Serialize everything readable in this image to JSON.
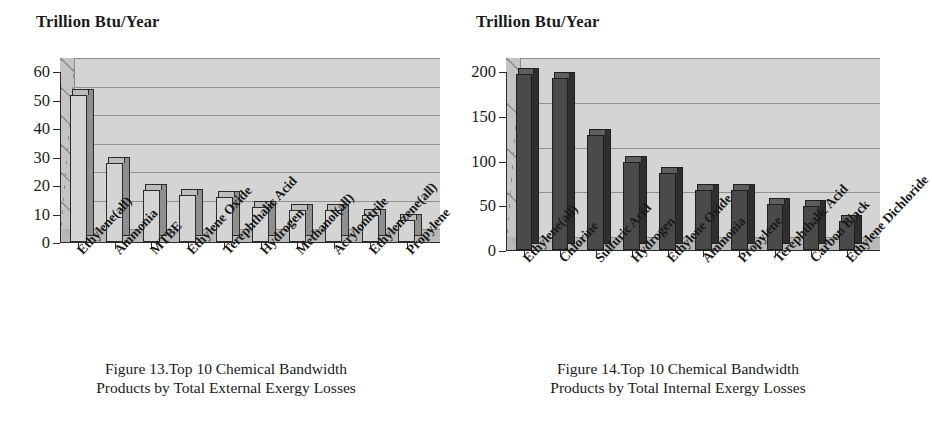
{
  "figures": [
    {
      "axis_title": "Trillion Btu/Year",
      "caption_line1": "Figure 13.Top 10 Chemical Bandwidth",
      "caption_line2": "Products by Total External Exergy Losses",
      "chart_data": {
        "type": "bar",
        "title": "Figure 13.Top 10 Chemical Bandwidth Products by Total External Exergy Losses",
        "xlabel": "",
        "ylabel": "Trillion Btu/Year",
        "ylim": [
          0,
          60
        ],
        "yticks": [
          0,
          10,
          20,
          30,
          40,
          50,
          60
        ],
        "ytick_labels": [
          "0",
          "10",
          "20",
          "30",
          "40",
          "50",
          "60"
        ],
        "grid": true,
        "legend": "none",
        "categories": [
          "Ethylene(all)",
          "Ammonia",
          "MTBE",
          "Ethylene Oxide",
          "Terephthalic Acid",
          "Hydrogen",
          "Methanol(all)",
          "Acrylonitrile",
          "Ethylenzene(all)",
          "Propylene"
        ],
        "values": [
          52,
          28,
          18.5,
          17,
          16,
          12.5,
          11.5,
          11.5,
          10,
          8
        ],
        "bar_fill": "#d4d4d4",
        "bar_edge": "#2b2b2b"
      }
    },
    {
      "axis_title": "Trillion Btu/Year",
      "caption_line1": "Figure 14.Top 10 Chemical Bandwidth",
      "caption_line2": "Products by Total Internal Exergy Losses",
      "chart_data": {
        "type": "bar",
        "title": "Figure 14.Top 10 Chemical Bandwidth Products by Total Internal Exergy Losses",
        "xlabel": "",
        "ylabel": "Trillion Btu/Year",
        "ylim": [
          0,
          200
        ],
        "yticks": [
          0,
          50,
          100,
          150,
          200
        ],
        "ytick_labels": [
          "0",
          "50",
          "100",
          "150",
          "200"
        ],
        "grid": true,
        "legend": "none",
        "categories": [
          "Ethylene(all)",
          "Chlorine",
          "Sulfuric Acid",
          "Hydrogen",
          "Ethylene Oxide",
          "Ammonia",
          "Propylene",
          "Terephthalic Acid",
          "Carbon Black",
          "Ethylene Dichloride"
        ],
        "values": [
          198,
          193,
          130,
          100,
          87,
          68,
          68,
          52,
          50,
          34
        ],
        "bar_fill": "#4a4a4a",
        "bar_edge": "#1f1f1f"
      }
    }
  ],
  "colors": {
    "plot_background": "#d4d4d4",
    "floor": "#b4b4b4",
    "gridline": "#8f8f8f",
    "axis": "#2b2b2b",
    "text": "#1a1a1a"
  }
}
